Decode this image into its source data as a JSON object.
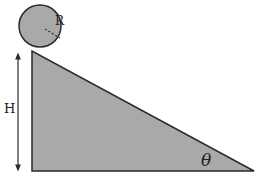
{
  "diagram": {
    "type": "physics-incline",
    "labels": {
      "radius": "R",
      "height": "H",
      "angle": "θ"
    },
    "colors": {
      "fill": "#a9a9a9",
      "stroke": "#2a2a2a",
      "background": "#ffffff"
    },
    "ball": {
      "cx": 40,
      "cy": 26,
      "r": 21
    },
    "incline": {
      "top": [
        32,
        51
      ],
      "bottom_left": [
        32,
        171
      ],
      "bottom_right": [
        254,
        171
      ]
    }
  }
}
